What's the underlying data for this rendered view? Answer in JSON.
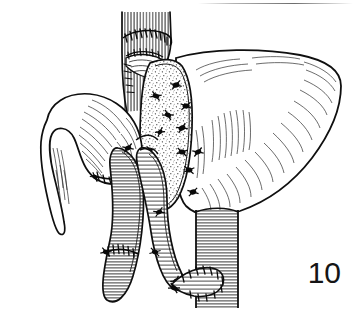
{
  "figure": {
    "number_label": "10",
    "caption_text": "",
    "background_color": "#ffffff",
    "ink_color": "#111111",
    "width_px": 355,
    "height_px": 316,
    "medium": "pen-and-ink line drawing"
  },
  "structures": {
    "suprahepatic_vena_cava": {
      "name": "suprahepatic vena cava",
      "anastomosis": "sutured ring anastomosis",
      "shading": "vertical hatching"
    },
    "liver": {
      "name": "liver",
      "cut_surface": "stippled resection surface with dark ligature knots",
      "ligature_count": 11,
      "body_shading": "fine curved hatching"
    },
    "stomach": {
      "name": "stomach and duodenum",
      "shading": "radial hatching",
      "suture_line": "running suture along greater curvature"
    },
    "portal_vein": {
      "name": "portal vein",
      "anastomosis": "circumferential sutured anastomosis",
      "shading": "transverse hatching"
    },
    "hepatic_artery": {
      "name": "hepatic artery",
      "anastomosis": "sutured anastomosis",
      "shading": "transverse hatching"
    },
    "infrahepatic_vena_cava": {
      "name": "infrahepatic vena cava",
      "anastomosis": "end-to-side sutured anastomosis",
      "shading": "transverse hatching"
    }
  },
  "annotations": {
    "scan_artifact": "faint gray scanner line along top edge"
  }
}
